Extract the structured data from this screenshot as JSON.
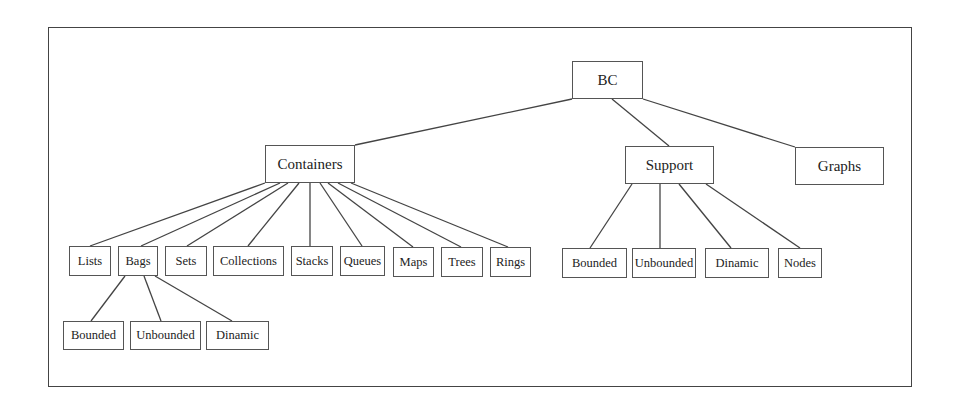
{
  "diagram": {
    "type": "tree",
    "colors": {
      "line": "#444444",
      "box_border": "#555555",
      "background": "#ffffff",
      "text": "#222222"
    },
    "root": {
      "id": "bc",
      "label": "BC",
      "box": [
        572,
        61,
        71,
        38
      ]
    },
    "nodes": [
      {
        "id": "containers",
        "label": "Containers",
        "parent": "bc",
        "level": 1,
        "box": [
          265,
          145,
          90,
          38
        ]
      },
      {
        "id": "support",
        "label": "Support",
        "parent": "bc",
        "level": 1,
        "box": [
          625,
          146,
          89,
          38
        ]
      },
      {
        "id": "graphs",
        "label": "Graphs",
        "parent": "bc",
        "level": 1,
        "box": [
          795,
          147,
          89,
          38
        ]
      },
      {
        "id": "lists",
        "label": "Lists",
        "parent": "containers",
        "level": 2,
        "box": [
          69,
          246,
          42,
          30
        ]
      },
      {
        "id": "bags",
        "label": "Bags",
        "parent": "containers",
        "level": 2,
        "box": [
          118,
          246,
          40,
          30
        ]
      },
      {
        "id": "sets",
        "label": "Sets",
        "parent": "containers",
        "level": 2,
        "box": [
          165,
          246,
          42,
          30
        ]
      },
      {
        "id": "collections",
        "label": "Collections",
        "parent": "containers",
        "level": 2,
        "box": [
          213,
          246,
          71,
          30
        ]
      },
      {
        "id": "stacks",
        "label": "Stacks",
        "parent": "containers",
        "level": 2,
        "box": [
          291,
          246,
          42,
          30
        ]
      },
      {
        "id": "queues",
        "label": "Queues",
        "parent": "containers",
        "level": 2,
        "box": [
          340,
          246,
          45,
          30
        ]
      },
      {
        "id": "maps",
        "label": "Maps",
        "parent": "containers",
        "level": 2,
        "box": [
          393,
          247,
          41,
          30
        ]
      },
      {
        "id": "trees",
        "label": "Trees",
        "parent": "containers",
        "level": 2,
        "box": [
          441,
          247,
          42,
          30
        ]
      },
      {
        "id": "rings",
        "label": "Rings",
        "parent": "containers",
        "level": 2,
        "box": [
          490,
          247,
          41,
          30
        ]
      },
      {
        "id": "bags-bounded",
        "label": "Bounded",
        "parent": "bags",
        "level": 3,
        "box": [
          63,
          321,
          61,
          29
        ]
      },
      {
        "id": "bags-unbounded",
        "label": "Unbounded",
        "parent": "bags",
        "level": 3,
        "box": [
          130,
          321,
          71,
          29
        ]
      },
      {
        "id": "bags-dinamic",
        "label": "Dinamic",
        "parent": "bags",
        "level": 3,
        "box": [
          206,
          321,
          63,
          29
        ]
      },
      {
        "id": "support-bounded",
        "label": "Bounded",
        "parent": "support",
        "level": 2,
        "box": [
          562,
          248,
          65,
          30
        ]
      },
      {
        "id": "support-unbounded",
        "label": "Unbounded",
        "parent": "support",
        "level": 2,
        "box": [
          632,
          248,
          64,
          30
        ]
      },
      {
        "id": "support-dinamic",
        "label": "Dinamic",
        "parent": "support",
        "level": 2,
        "box": [
          705,
          248,
          64,
          30
        ]
      },
      {
        "id": "support-nodes",
        "label": "Nodes",
        "parent": "support",
        "level": 2,
        "box": [
          778,
          248,
          44,
          30
        ]
      }
    ],
    "edges": [
      {
        "from": [
          572,
          99
        ],
        "to": [
          355,
          145
        ]
      },
      {
        "from": [
          612,
          99
        ],
        "to": [
          669,
          146
        ]
      },
      {
        "from": [
          643,
          99
        ],
        "to": [
          795,
          147
        ]
      },
      {
        "from": [
          265,
          183
        ],
        "to": [
          90,
          246
        ]
      },
      {
        "from": [
          280,
          183
        ],
        "to": [
          141,
          246
        ]
      },
      {
        "from": [
          288,
          183
        ],
        "to": [
          187,
          246
        ]
      },
      {
        "from": [
          299,
          183
        ],
        "to": [
          248,
          246
        ]
      },
      {
        "from": [
          310,
          183
        ],
        "to": [
          310,
          246
        ]
      },
      {
        "from": [
          320,
          183
        ],
        "to": [
          362,
          246
        ]
      },
      {
        "from": [
          328,
          183
        ],
        "to": [
          413,
          247
        ]
      },
      {
        "from": [
          338,
          183
        ],
        "to": [
          461,
          247
        ]
      },
      {
        "from": [
          351,
          183
        ],
        "to": [
          508,
          247
        ]
      },
      {
        "from": [
          125,
          276
        ],
        "to": [
          91,
          321
        ]
      },
      {
        "from": [
          144,
          276
        ],
        "to": [
          161,
          321
        ]
      },
      {
        "from": [
          155,
          276
        ],
        "to": [
          232,
          321
        ]
      },
      {
        "from": [
          632,
          184
        ],
        "to": [
          590,
          248
        ]
      },
      {
        "from": [
          660,
          184
        ],
        "to": [
          660,
          248
        ]
      },
      {
        "from": [
          679,
          184
        ],
        "to": [
          731,
          248
        ]
      },
      {
        "from": [
          706,
          184
        ],
        "to": [
          800,
          248
        ]
      }
    ]
  }
}
